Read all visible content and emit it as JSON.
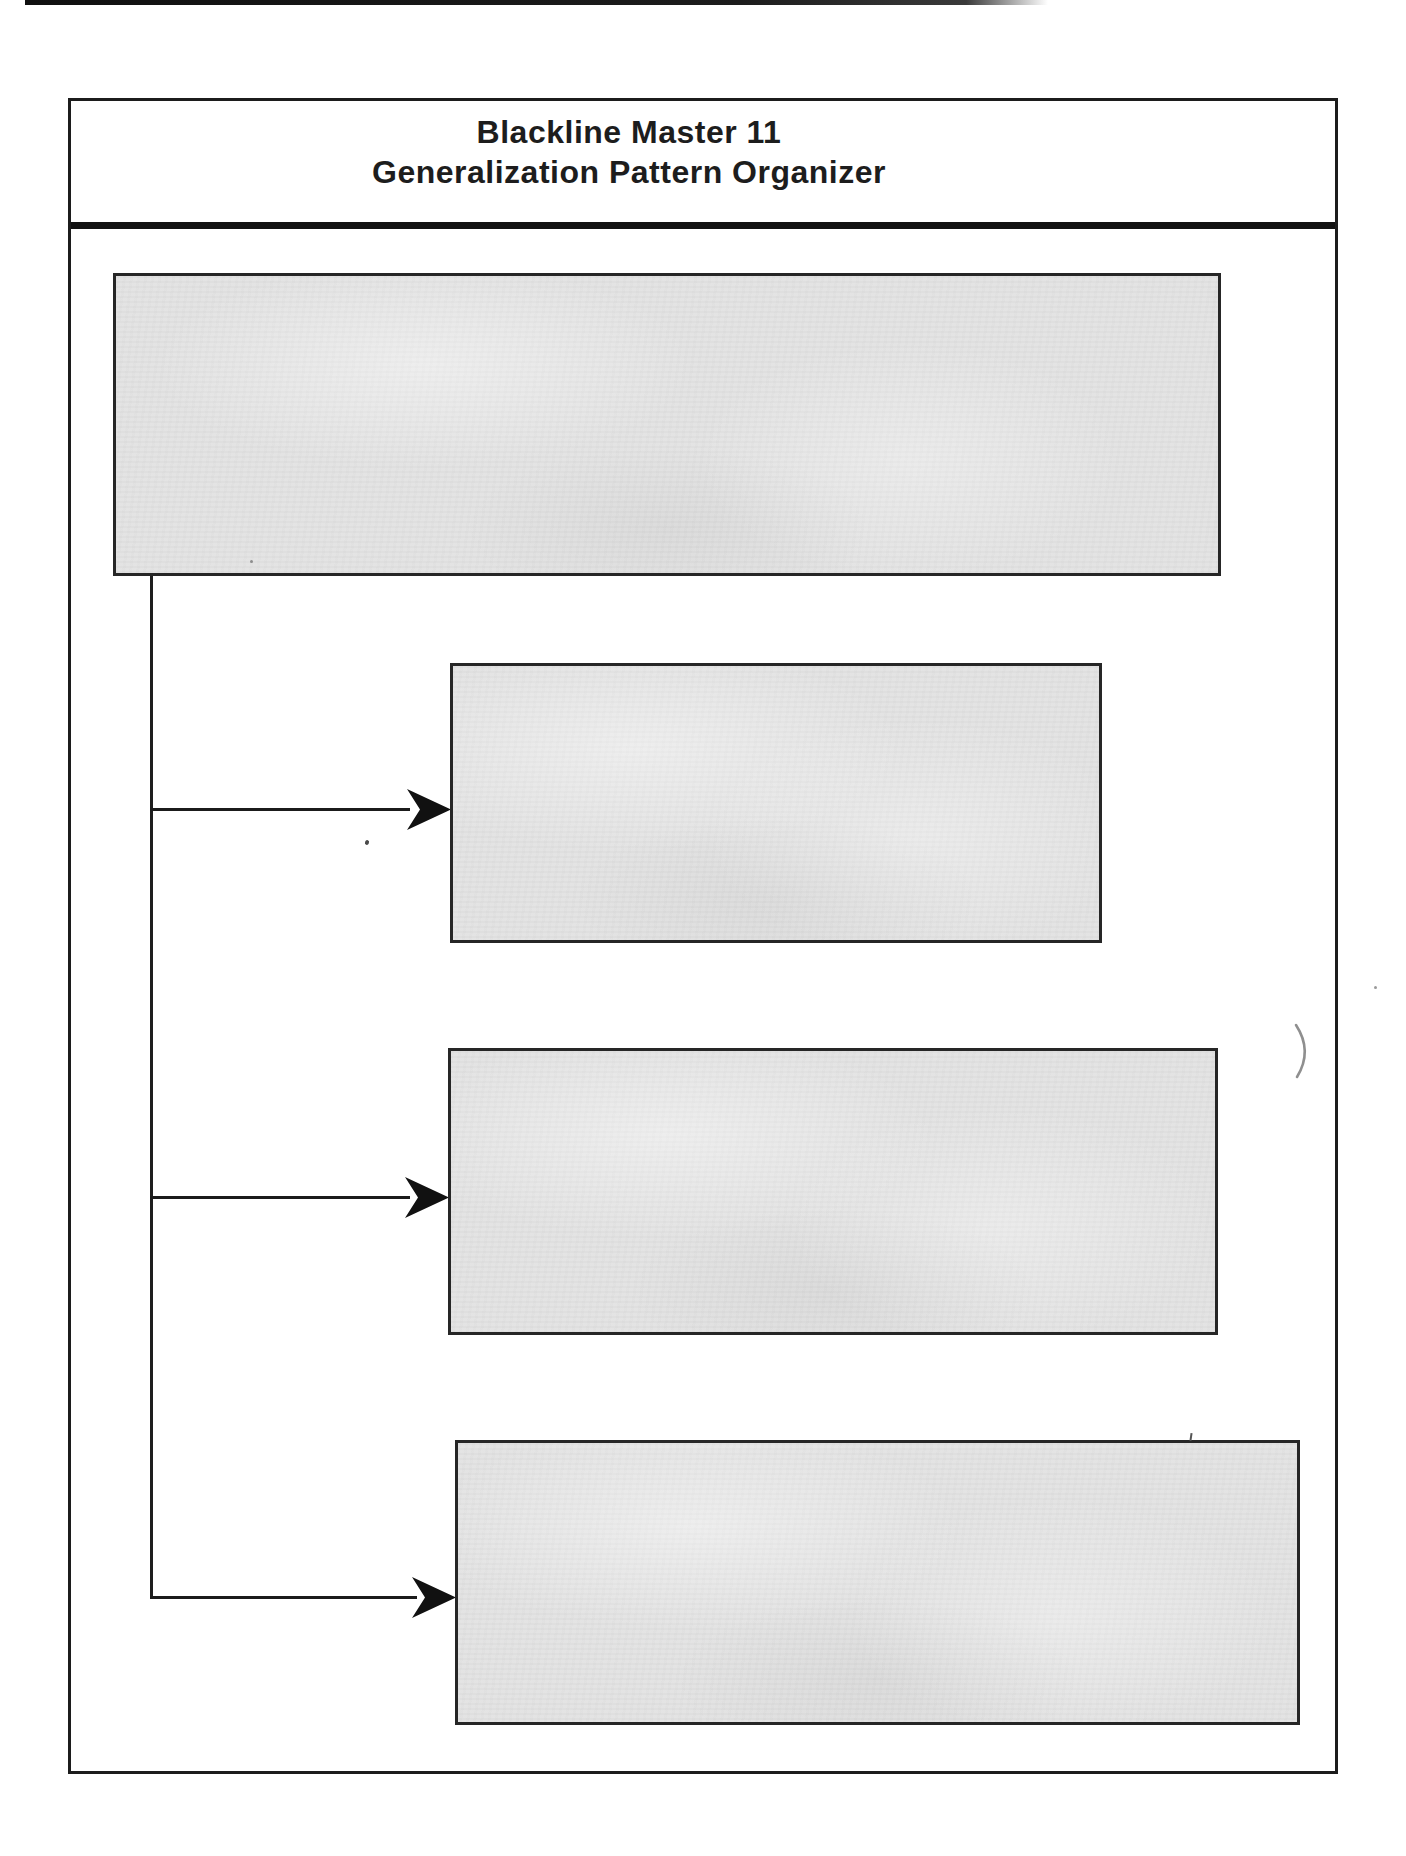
{
  "document": {
    "title_line1": "Blackline Master 11",
    "title_line2": "Generalization Pattern Organizer"
  },
  "organizer": {
    "generalization_box": {
      "value": ""
    },
    "detail_boxes": [
      {
        "value": ""
      },
      {
        "value": ""
      },
      {
        "value": ""
      }
    ]
  },
  "annotations": {
    "stray_pen_mark": ")"
  },
  "colors": {
    "page_background": "#ffffff",
    "box_fill": "#e3e3e3",
    "line_color": "#1c1c1c",
    "arrow_color": "#111111"
  }
}
